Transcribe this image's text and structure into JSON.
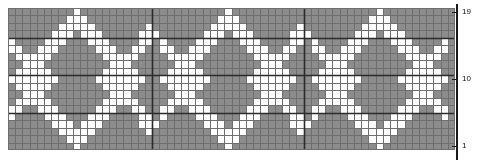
{
  "chart": {
    "type": "pattern-grid",
    "grid": {
      "columns": 62,
      "rows": 19,
      "cell_width_px": 7.21,
      "cell_height_px": 7.47,
      "origin_x_px": 8,
      "origin_y_px": 8
    },
    "colors": {
      "background_cell": "#8c8c8c",
      "pattern_cell": "#ffffff",
      "grid_line_minor": "#6e6e6e",
      "grid_line_major": "#2b2b2b",
      "axis_line": "#1a1a1a",
      "label_text": "#111111",
      "page_background": "#ffffff"
    },
    "major_lines": {
      "vertical_columns": [
        20,
        41
      ],
      "horizontal_rows": [
        5,
        10,
        15
      ]
    },
    "axis": {
      "position": "right",
      "direction": "bottom-to-top",
      "labels": [
        {
          "row": 1,
          "text": "1"
        },
        {
          "row": 10,
          "text": "10"
        },
        {
          "row": 19,
          "text": "19"
        }
      ]
    },
    "legend": {
      "background_label": "background colour",
      "pattern_label": "contrast colour"
    },
    "pattern": {
      "description": "62 columns x 19 rows. Row 1 is the bottom row, row 19 the top. Each string has 62 characters: '1' = white contrast stitch, '0' = grey background stitch.",
      "rows_bottom_to_top": [
        "00010000000000000000010000000000000000010000000000000000010000",
        "00111000000000000000111000000000000000111000000000000000111000",
        "01110100000000000001110100000000000001110100000000000001110100",
        "00010000000000000000010000000000000000010000000000000000010000",
        "00000000000000000000000000000000000000000000000000000000000000",
        "00000000000001000000000000000010000000000000000100000000000000",
        "00000000000011100000000000000111000000000000001110000000000000",
        "00000000000001000000000000000010000000000000000100000000000000",
        "00000000000000000000000000000000000000000000000000000000000000",
        "00000000000000000000000000000000000000000000000000000000000000",
        "00000000000001000000000000000010000000000000000100000000000000",
        "00000000000011100000000000000111000000000000001110000000000000",
        "00000000000001000000000000000010000000000000000100000000000000",
        "00000000000000000000000000000000000000000000000000000000000000",
        "00010000000000000000010000000000000000010000000000000000010000",
        "00111000000000000000111000000000000000111000000000000000111000",
        "01110100000000000001110100000000000001110100000000000001110100",
        "00010000000000000000010000000000000000010000000000000000010000",
        "00000000000000000000000000000000000000000000000000000000000000"
      ],
      "star_motif": {
        "name": "eight-pointed-star",
        "size": 19,
        "centers_column": [
          10,
          31,
          52
        ],
        "center_row": 10,
        "rows_bottom_to_top": [
          "0000000001000000000",
          "0000000011100000000",
          "0000000111110000000",
          "0000001110111000000",
          "1000011100011100001",
          "1100111000001110011",
          "0111110000000111110",
          "0011100000000011100",
          "0111110000000111110",
          "1111111000001111111",
          "0111110000000111110",
          "0011100000000011100",
          "0111110000000111110",
          "1100111000001110011",
          "1000011100011100001",
          "0000001110111000000",
          "0000000111110000000",
          "0000000011100000000",
          "0000000001000000000"
        ]
      },
      "plus_motif": {
        "name": "small-plus",
        "size": 3,
        "rows_bottom_to_top": [
          "010",
          "111",
          "010"
        ],
        "centers": [
          {
            "column": 20,
            "row": 16
          },
          {
            "column": 41,
            "row": 16
          },
          {
            "column": 20,
            "row": 4
          },
          {
            "column": 41,
            "row": 4
          }
        ]
      }
    }
  }
}
